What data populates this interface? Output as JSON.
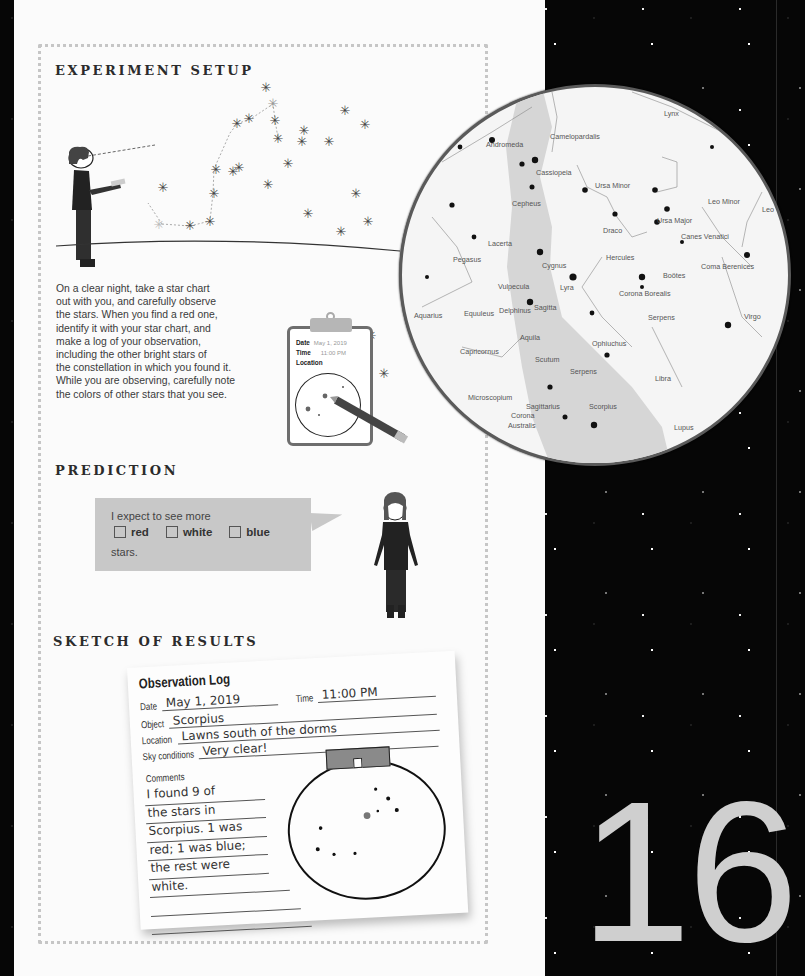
{
  "page_number": "16",
  "sections": {
    "setup": {
      "title": "EXPERIMENT SETUP",
      "body_lines": [
        "On a clear night, take a star chart",
        "out with you, and carefully observe",
        "the stars. When you find a red one,",
        "identify it with your star chart, and",
        "make a log of your observation,",
        "including the other bright stars of",
        "the constellation in which you found it.",
        "While you are observing, carefully note",
        "the colors of other stars that you see."
      ],
      "clipboard": {
        "date_label": "Date",
        "date_value": "May 1, 2019",
        "time_label": "Time",
        "time_value": "11:00 PM",
        "location_label": "Location"
      }
    },
    "prediction": {
      "title": "PREDICTION",
      "line1": "I expect to see more",
      "options": [
        {
          "label": "red",
          "checked": false
        },
        {
          "label": "white",
          "checked": false
        },
        {
          "label": "blue",
          "checked": false
        }
      ],
      "line3": "stars."
    },
    "results": {
      "title": "SKETCH OF RESULTS",
      "log": {
        "title": "Observation Log",
        "date_label": "Date",
        "date_value": "May 1, 2019",
        "time_label": "Time",
        "time_value": "11:00 PM",
        "object_label": "Object",
        "object_value": "Scorpius",
        "location_label": "Location",
        "location_value": "Lawns south of the dorms",
        "sky_label": "Sky conditions",
        "sky_value": "Very clear!",
        "comments_label": "Comments",
        "comments_lines": [
          "I found 9 of",
          "the stars in",
          "Scorpius. 1 was",
          "red; 1 was blue;",
          "the rest were",
          "white.",
          "",
          ""
        ]
      }
    }
  },
  "star_chart": {
    "constellations": [
      {
        "name": "Lynx",
        "x": 262,
        "y": 22
      },
      {
        "name": "Camelopardalis",
        "x": 148,
        "y": 45
      },
      {
        "name": "Andromeda",
        "x": 84,
        "y": 53
      },
      {
        "name": "Cassiopeia",
        "x": 134,
        "y": 81
      },
      {
        "name": "Ursa Minor",
        "x": 193,
        "y": 94
      },
      {
        "name": "Cepheus",
        "x": 110,
        "y": 112
      },
      {
        "name": "Leo Minor",
        "x": 306,
        "y": 110
      },
      {
        "name": "Leo",
        "x": 360,
        "y": 118
      },
      {
        "name": "Ursa Major",
        "x": 255,
        "y": 129
      },
      {
        "name": "Draco",
        "x": 201,
        "y": 139
      },
      {
        "name": "Canes Venatici",
        "x": 279,
        "y": 145
      },
      {
        "name": "Lacerta",
        "x": 86,
        "y": 152
      },
      {
        "name": "Pegasus",
        "x": 51,
        "y": 168
      },
      {
        "name": "Hercules",
        "x": 204,
        "y": 166
      },
      {
        "name": "Cygnus",
        "x": 140,
        "y": 174
      },
      {
        "name": "Coma Berenices",
        "x": 299,
        "y": 175
      },
      {
        "name": "Boötes",
        "x": 261,
        "y": 184
      },
      {
        "name": "Vulpecula",
        "x": 96,
        "y": 195
      },
      {
        "name": "Lyra",
        "x": 158,
        "y": 196
      },
      {
        "name": "Corona Borealis",
        "x": 217,
        "y": 202
      },
      {
        "name": "Aquarius",
        "x": 12,
        "y": 224
      },
      {
        "name": "Equuleus",
        "x": 62,
        "y": 222
      },
      {
        "name": "Delphinus",
        "x": 97,
        "y": 219
      },
      {
        "name": "Sagitta",
        "x": 132,
        "y": 216
      },
      {
        "name": "Serpens",
        "x": 246,
        "y": 226
      },
      {
        "name": "Virgo",
        "x": 342,
        "y": 225
      },
      {
        "name": "Aquila",
        "x": 118,
        "y": 246
      },
      {
        "name": "Ophiuchus",
        "x": 190,
        "y": 252
      },
      {
        "name": "Capricornus",
        "x": 58,
        "y": 260
      },
      {
        "name": "Scutum",
        "x": 133,
        "y": 268
      },
      {
        "name": "Serpens",
        "x": 168,
        "y": 280
      },
      {
        "name": "Libra",
        "x": 253,
        "y": 287
      },
      {
        "name": "Microscopium",
        "x": 66,
        "y": 306
      },
      {
        "name": "Sagittarius",
        "x": 124,
        "y": 315
      },
      {
        "name": "Scorpius",
        "x": 187,
        "y": 315
      },
      {
        "name": "Corona",
        "x": 109,
        "y": 324
      },
      {
        "name": "Australis",
        "x": 106,
        "y": 334
      },
      {
        "name": "Lupus",
        "x": 272,
        "y": 336
      }
    ]
  }
}
